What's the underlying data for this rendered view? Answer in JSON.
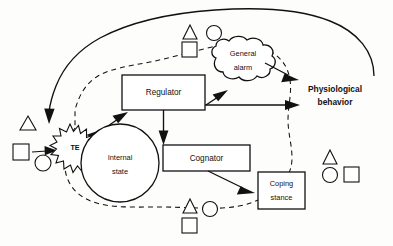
{
  "diagram": {
    "nodes": {
      "regulator": "Regulator",
      "cognator": "Cognator",
      "internal_state_line1": "Internal",
      "internal_state_line2": "state",
      "general_alarm_line1": "General",
      "general_alarm_line2": "alarm",
      "coping_stance_line1": "Coping",
      "coping_stance_line2": "stance",
      "te": "TE",
      "output_line1": "Physiological",
      "output_line2": "behavior"
    },
    "symbol_clusters": [
      {
        "name": "left-stimuli",
        "symbols": [
          {
            "shape": "triangle",
            "x": 28,
            "y": 124
          },
          {
            "shape": "square",
            "x": 22,
            "y": 152
          },
          {
            "shape": "circle",
            "x": 43,
            "y": 163
          }
        ]
      },
      {
        "name": "top-stimuli",
        "symbols": [
          {
            "shape": "triangle",
            "x": 190,
            "y": 32
          },
          {
            "shape": "circle",
            "x": 214,
            "y": 33
          },
          {
            "shape": "square",
            "x": 190,
            "y": 48
          }
        ]
      },
      {
        "name": "bottom-stimuli",
        "symbols": [
          {
            "shape": "triangle",
            "x": 190,
            "y": 206
          },
          {
            "shape": "circle",
            "x": 210,
            "y": 209
          },
          {
            "shape": "square",
            "x": 190,
            "y": 226
          }
        ]
      },
      {
        "name": "right-stimuli",
        "symbols": [
          {
            "shape": "triangle",
            "x": 330,
            "y": 157
          },
          {
            "shape": "circle",
            "x": 330,
            "y": 175
          },
          {
            "shape": "square",
            "x": 351,
            "y": 174
          }
        ]
      }
    ],
    "edges": [
      {
        "name": "stimulus-to-te",
        "from": "square-stimulus",
        "to": "te"
      },
      {
        "name": "te-to-regulator",
        "from": "te",
        "to": "regulator"
      },
      {
        "name": "regulator-to-general-alarm",
        "from": "regulator",
        "to": "general-alarm"
      },
      {
        "name": "regulator-to-cognator",
        "from": "regulator",
        "to": "cognator"
      },
      {
        "name": "regulator-to-behavior",
        "from": "regulator",
        "to": "physiological-behavior"
      },
      {
        "name": "general-alarm-to-behavior",
        "from": "general-alarm",
        "to": "physiological-behavior"
      },
      {
        "name": "cognator-to-coping-stance",
        "from": "cognator",
        "to": "coping-stance"
      },
      {
        "name": "feedback-loop",
        "from": "physiological-behavior",
        "to": "te"
      }
    ],
    "colors": {
      "ink": "#111111",
      "paper": "#fdfdfc"
    }
  }
}
